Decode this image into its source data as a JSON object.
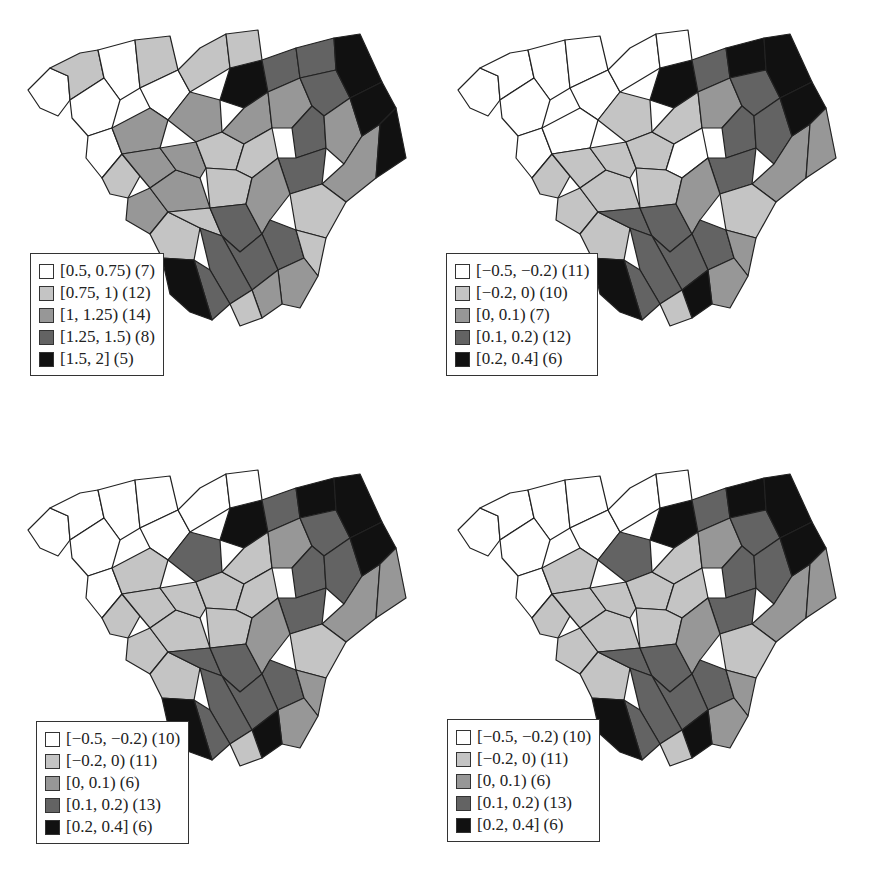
{
  "colors": {
    "class0": "#ffffff",
    "class1": "#c4c4c4",
    "class2": "#979797",
    "class3": "#636363",
    "class4": "#111111",
    "border": "#222222"
  },
  "panels": [
    {
      "id": "top-left",
      "legend": [
        {
          "label": "[0.5, 0.75) (7)",
          "class": 0
        },
        {
          "label": "[0.75, 1) (12)",
          "class": 1
        },
        {
          "label": "[1, 1.25) (14)",
          "class": 2
        },
        {
          "label": "[1.25, 1.5) (8)",
          "class": 3
        },
        {
          "label": "[1.5, 2] (5)",
          "class": 4
        }
      ]
    },
    {
      "id": "top-right",
      "legend": [
        {
          "label": "[−0.5, −0.2) (11)",
          "class": 0
        },
        {
          "label": "[−0.2, 0) (10)",
          "class": 1
        },
        {
          "label": "[0, 0.1) (7)",
          "class": 2
        },
        {
          "label": "[0.1, 0.2) (12)",
          "class": 3
        },
        {
          "label": "[0.2, 0.4] (6)",
          "class": 4
        }
      ]
    },
    {
      "id": "bottom-left",
      "legend": [
        {
          "label": "[−0.5, −0.2) (10)",
          "class": 0
        },
        {
          "label": "[−0.2, 0) (11)",
          "class": 1
        },
        {
          "label": "[0, 0.1) (6)",
          "class": 2
        },
        {
          "label": "[0.1, 0.2) (13)",
          "class": 3
        },
        {
          "label": "[0.2, 0.4] (6)",
          "class": 4
        }
      ]
    },
    {
      "id": "bottom-right",
      "legend": [
        {
          "label": "[−0.5, −0.2) (10)",
          "class": 0
        },
        {
          "label": "[−0.2, 0) (11)",
          "class": 1
        },
        {
          "label": "[0, 0.1) (6)",
          "class": 2
        },
        {
          "label": "[0.1, 0.2) (13)",
          "class": 3
        },
        {
          "label": "[0.2, 0.4] (6)",
          "class": 4
        }
      ]
    }
  ],
  "chart_data": [
    {
      "type": "heatmap",
      "title": "",
      "subtype": "choropleth map (South Carolina counties, 46)",
      "legend_position": "lower-left",
      "classes": [
        "[0.5, 0.75)",
        "[0.75, 1)",
        "[1, 1.25)",
        "[1.25, 1.5)",
        "[1.5, 2]"
      ],
      "counts": [
        7,
        12,
        14,
        8,
        5
      ],
      "county_classes": [
        0,
        1,
        0,
        0,
        1,
        0,
        1,
        0,
        2,
        1,
        2,
        2,
        2,
        2,
        4,
        1,
        2,
        1,
        2,
        3,
        3,
        2,
        1,
        1,
        1,
        1,
        3,
        3,
        3,
        3,
        2,
        2,
        2,
        1,
        3,
        3,
        3,
        3,
        1,
        2,
        2,
        4,
        4,
        4,
        4,
        1
      ]
    },
    {
      "type": "heatmap",
      "title": "",
      "subtype": "choropleth map (South Carolina counties, 46)",
      "legend_position": "lower-left",
      "classes": [
        "[−0.5, −0.2)",
        "[−0.2, 0)",
        "[0, 0.1)",
        "[0.1, 0.2)",
        "[0.2, 0.4]"
      ],
      "counts": [
        11,
        10,
        7,
        12,
        6
      ],
      "county_classes": [
        0,
        0,
        0,
        0,
        0,
        0,
        0,
        0,
        0,
        1,
        1,
        1,
        1,
        1,
        4,
        0,
        1,
        1,
        1,
        3,
        4,
        2,
        0,
        1,
        1,
        3,
        3,
        3,
        3,
        3,
        2,
        3,
        2,
        1,
        3,
        3,
        3,
        3,
        2,
        2,
        4,
        4,
        4,
        4,
        2,
        1
      ]
    },
    {
      "type": "heatmap",
      "title": "",
      "subtype": "choropleth map (South Carolina counties, 46)",
      "legend_position": "lower-left",
      "classes": [
        "[−0.5, −0.2)",
        "[−0.2, 0)",
        "[0, 0.1)",
        "[0.1, 0.2)",
        "[0.2, 0.4]"
      ],
      "counts": [
        10,
        11,
        6,
        13,
        6
      ],
      "county_classes": [
        0,
        0,
        0,
        0,
        0,
        0,
        0,
        0,
        1,
        1,
        1,
        1,
        1,
        3,
        4,
        0,
        1,
        1,
        1,
        3,
        4,
        2,
        1,
        1,
        1,
        3,
        3,
        3,
        3,
        3,
        2,
        3,
        2,
        1,
        3,
        3,
        3,
        3,
        2,
        2,
        4,
        4,
        4,
        4,
        2,
        1
      ]
    },
    {
      "type": "heatmap",
      "title": "",
      "subtype": "choropleth map (South Carolina counties, 46)",
      "legend_position": "lower-left",
      "classes": [
        "[−0.5, −0.2)",
        "[−0.2, 0)",
        "[0, 0.1)",
        "[0.1, 0.2)",
        "[0.2, 0.4]"
      ],
      "counts": [
        10,
        11,
        6,
        13,
        6
      ],
      "county_classes": [
        0,
        0,
        0,
        0,
        0,
        0,
        0,
        0,
        1,
        1,
        1,
        1,
        1,
        3,
        4,
        0,
        1,
        1,
        1,
        3,
        4,
        2,
        1,
        1,
        1,
        3,
        3,
        3,
        3,
        3,
        2,
        3,
        2,
        1,
        3,
        3,
        3,
        3,
        2,
        2,
        4,
        4,
        4,
        4,
        2,
        1
      ]
    }
  ]
}
